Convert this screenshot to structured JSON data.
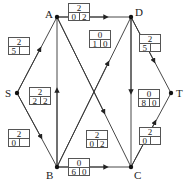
{
  "nodes": [
    {
      "id": "A",
      "label": "A",
      "x": 57,
      "y": 17
    },
    {
      "id": "D",
      "label": "D",
      "x": 131,
      "y": 17
    },
    {
      "id": "S",
      "label": "S",
      "x": 17,
      "y": 93
    },
    {
      "id": "T",
      "label": "T",
      "x": 171,
      "y": 93
    },
    {
      "id": "B",
      "label": "B",
      "x": 57,
      "y": 167
    },
    {
      "id": "C",
      "label": "C",
      "x": 131,
      "y": 167
    }
  ],
  "edges": [
    {
      "from": "S",
      "to": "A"
    },
    {
      "from": "S",
      "to": "B"
    },
    {
      "from": "B",
      "to": "A"
    },
    {
      "from": "A",
      "to": "D"
    },
    {
      "from": "A",
      "to": "C"
    },
    {
      "from": "B",
      "to": "D"
    },
    {
      "from": "D",
      "to": "C"
    },
    {
      "from": "D",
      "to": "T"
    },
    {
      "from": "B",
      "to": "C"
    },
    {
      "from": "C",
      "to": "T"
    }
  ],
  "boxes": {
    "a_node": {
      "top": "2",
      "left": "0",
      "right": "2"
    },
    "s_a": {
      "top": "2",
      "left": "5",
      "right": ""
    },
    "b_a": {
      "top": "2",
      "left": "2",
      "right": "2"
    },
    "s_b": {
      "top": "2",
      "left": "0",
      "right": ""
    },
    "b_d": {
      "top": "0",
      "left": "1",
      "right": "0"
    },
    "d_t": {
      "top": "2",
      "left": "5",
      "right": ""
    },
    "d_c": {
      "top": "0",
      "left": "8",
      "right": "0"
    },
    "a_c": {
      "top": "2",
      "left": "0",
      "right": "2"
    },
    "c_t": {
      "top": "2",
      "left": "0",
      "right": ""
    },
    "b_c": {
      "top": "0",
      "left": "6",
      "right": "0"
    }
  }
}
